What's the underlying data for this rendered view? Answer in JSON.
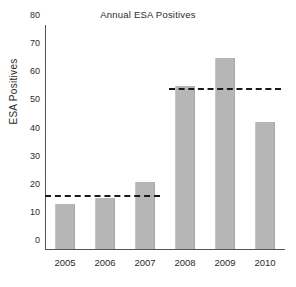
{
  "chart_data": {
    "type": "bar",
    "title": "Annual ESA Positives",
    "xlabel": "",
    "ylabel": "ESA Positives",
    "categories": [
      "2005",
      "2006",
      "2007",
      "2008",
      "2009",
      "2010"
    ],
    "values": [
      16,
      18,
      24,
      58,
      68,
      45
    ],
    "ylim": [
      0,
      80
    ],
    "yticks": [
      0,
      10,
      20,
      30,
      40,
      50,
      60,
      70,
      80
    ],
    "grid": false,
    "legend": "none",
    "series": [
      {
        "name": "ESA Positives",
        "values": [
          16,
          18,
          24,
          58,
          68,
          45
        ]
      }
    ],
    "annotations": [
      {
        "name": "mean-2005-2007",
        "type": "reference-line",
        "style": "dashed",
        "value": 19,
        "span_categories": [
          "2005",
          "2006",
          "2007"
        ]
      },
      {
        "name": "mean-2008-2010",
        "type": "reference-line",
        "style": "dashed",
        "value": 57,
        "span_categories": [
          "2008",
          "2009",
          "2010"
        ]
      }
    ],
    "colors": {
      "bar": "#b6b6b6",
      "reference_line": "#1a1a1a",
      "axis": "#555555",
      "text": "#2b2b2b",
      "background": "#ffffff"
    }
  }
}
